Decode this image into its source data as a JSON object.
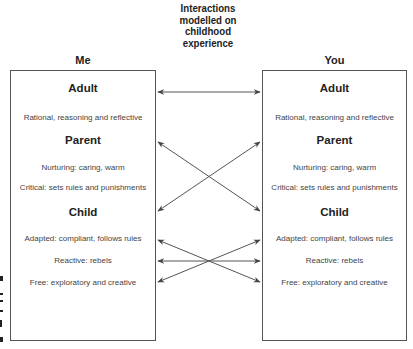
{
  "title": [
    "Interactions",
    "modelled on",
    "childhood",
    "experience"
  ],
  "left": {
    "label": "Me",
    "sections": [
      {
        "heading": "Adult",
        "items": [
          "Rational, reasoning and reflective"
        ]
      },
      {
        "heading": "Parent",
        "items": [
          "Nurturing: caring, warm",
          "Critical: sets rules and punishments"
        ]
      },
      {
        "heading": "Child",
        "items": [
          "Adapted: compliant, follows rules",
          "Reactive: rebels",
          "Free: exploratory and creative"
        ]
      }
    ]
  },
  "right": {
    "label": "You",
    "sections": [
      {
        "heading": "Adult",
        "items": [
          "Rational, reasoning and reflective"
        ]
      },
      {
        "heading": "Parent",
        "items": [
          "Nurturing: caring, warm",
          "Critical: sets rules and punishments"
        ]
      },
      {
        "heading": "Child",
        "items": [
          "Adapted: compliant, follows rules",
          "Reactive: rebels",
          "Free: exploratory and creative"
        ]
      }
    ]
  },
  "arrows": [
    {
      "from": "Me Adult",
      "to": "You Adult",
      "type": "double"
    },
    {
      "from": "Me Parent",
      "to": "You Child",
      "type": "double"
    },
    {
      "from": "Me Child",
      "to": "You Parent",
      "type": "double"
    },
    {
      "from": "Me Adapted",
      "to": "You Free",
      "type": "double"
    },
    {
      "from": "Me Reactive",
      "to": "You Reactive",
      "type": "double"
    },
    {
      "from": "Me Free",
      "to": "You Adapted",
      "type": "double"
    }
  ],
  "colors": {
    "line": "#555555",
    "text": "#333333",
    "heading": "#222222"
  }
}
